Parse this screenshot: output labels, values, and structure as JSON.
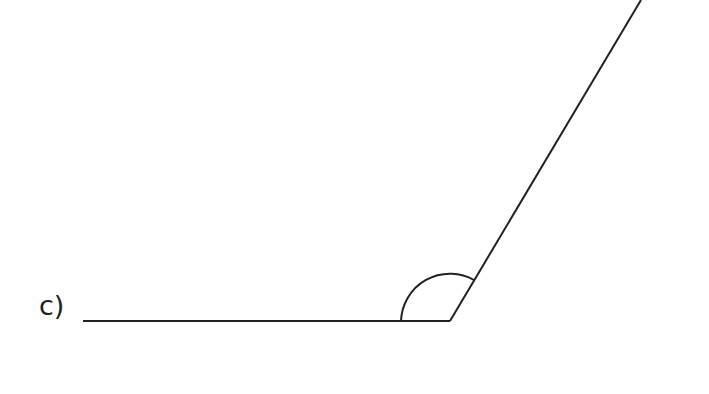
{
  "diagram": {
    "label": "c)",
    "stroke_color": "#222222",
    "vertex": [
      450,
      321
    ],
    "ray_left_end": [
      83,
      321
    ],
    "ray_up_end": [
      641,
      0
    ],
    "angle_marker": "obtuse-arc"
  }
}
